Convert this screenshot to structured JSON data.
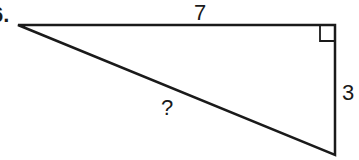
{
  "problem": {
    "number": "6.",
    "figure": "right-triangle",
    "sides": {
      "top_leg": "7",
      "right_leg": "3",
      "hypotenuse": "?"
    },
    "right_angle_marker": "top-right-vertex",
    "colors": {
      "stroke": "#1a1a1a",
      "background": "#ffffff"
    }
  }
}
